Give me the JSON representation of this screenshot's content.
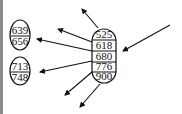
{
  "diagram": {
    "type": "b-tree-node",
    "center_node": {
      "keys": [
        "525",
        "618",
        "680",
        "776",
        "900"
      ]
    },
    "left_nodes": [
      {
        "keys": [
          "639",
          "656"
        ]
      },
      {
        "keys": [
          "713",
          "748"
        ]
      }
    ],
    "colors": {
      "stroke": "#111111",
      "background": "#ffffff",
      "border": "#8a8a8a"
    }
  }
}
